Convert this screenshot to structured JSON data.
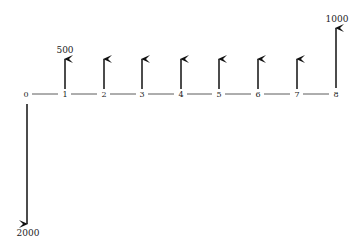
{
  "diagram": {
    "type": "cash-flow-diagram",
    "periods": [
      "0",
      "1",
      "2",
      "3",
      "4",
      "5",
      "6",
      "7",
      "8"
    ],
    "cash_flows": [
      {
        "period": "0",
        "direction": "down",
        "amount_label": "2000"
      },
      {
        "period": "1",
        "direction": "up",
        "amount_label": "500"
      },
      {
        "period": "2",
        "direction": "up",
        "amount_label": ""
      },
      {
        "period": "3",
        "direction": "up",
        "amount_label": ""
      },
      {
        "period": "4",
        "direction": "up",
        "amount_label": ""
      },
      {
        "period": "5",
        "direction": "up",
        "amount_label": ""
      },
      {
        "period": "6",
        "direction": "up",
        "amount_label": ""
      },
      {
        "period": "7",
        "direction": "up",
        "amount_label": ""
      },
      {
        "period": "8",
        "direction": "up",
        "amount_label": "1000"
      }
    ],
    "colors": {
      "line": "#222222",
      "arrow": "#111111",
      "background": "#ffffff"
    }
  }
}
